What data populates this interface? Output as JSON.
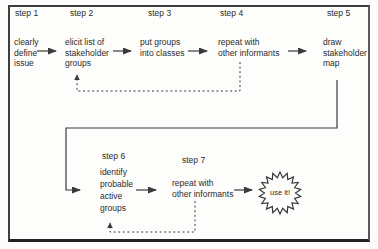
{
  "diagram": {
    "steps": [
      {
        "label": "step 1",
        "text": "clearly\ndefine\nissue"
      },
      {
        "label": "step 2",
        "text": "elicit list of\nstakeholder\ngroups"
      },
      {
        "label": "step 3",
        "text": "put groups\ninto classes"
      },
      {
        "label": "step 4",
        "text": "repeat with\nother informants"
      },
      {
        "label": "step 5",
        "text": "draw\nstakeholder\nmap"
      },
      {
        "label": "step 6",
        "text": "identify\nprobable\nactive\ngroups"
      },
      {
        "label": "step 7",
        "text": "repeat with\nother informants"
      }
    ],
    "burst": {
      "label": "use it!"
    },
    "colors": {
      "line": "#3a3a3a",
      "text": "#2b2b2b",
      "frame_border": "#3d3d3d",
      "background": "#fcfcfb"
    }
  }
}
